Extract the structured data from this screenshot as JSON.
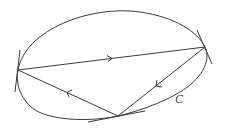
{
  "diagram": {
    "curve_label": "C",
    "colors": {
      "stroke": "#3a3a3a",
      "label": "#444444",
      "background": "#ffffff"
    },
    "vertices": [
      {
        "name": "left",
        "x": 18,
        "y": 70
      },
      {
        "name": "right",
        "x": 205,
        "y": 47
      },
      {
        "name": "bottom",
        "x": 118,
        "y": 116
      }
    ],
    "edges": [
      {
        "from": "left",
        "to": "right",
        "arrow_direction": "right"
      },
      {
        "from": "right",
        "to": "bottom",
        "arrow_direction": "down-left"
      },
      {
        "from": "bottom",
        "to": "left",
        "arrow_direction": "up-left"
      }
    ]
  }
}
